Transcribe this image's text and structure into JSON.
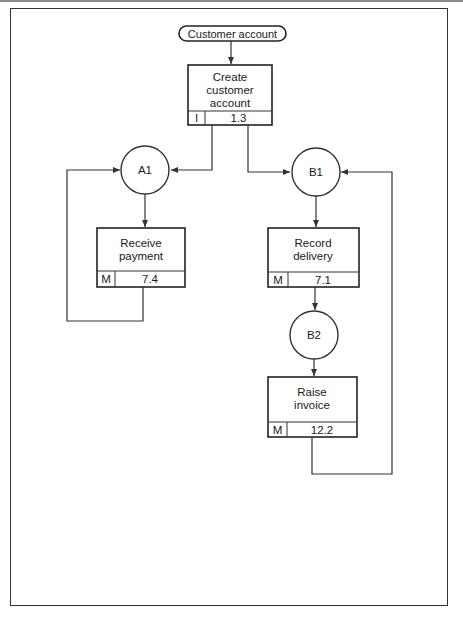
{
  "diagram": {
    "start": {
      "label": "Customer account"
    },
    "processes": [
      {
        "id": "create",
        "lines": [
          "Create",
          "customer",
          "account"
        ],
        "type": "I",
        "number": "1.3"
      },
      {
        "id": "receive",
        "lines": [
          "Receive",
          "payment"
        ],
        "type": "M",
        "number": "7.4"
      },
      {
        "id": "record",
        "lines": [
          "Record",
          "delivery"
        ],
        "type": "M",
        "number": "7.1"
      },
      {
        "id": "raise",
        "lines": [
          "Raise",
          "invoice"
        ],
        "type": "M",
        "number": "12.2"
      }
    ],
    "states": [
      {
        "id": "A1",
        "label": "A1"
      },
      {
        "id": "B1",
        "label": "B1"
      },
      {
        "id": "B2",
        "label": "B2"
      }
    ],
    "colors": {
      "line": "#333333",
      "background": "#ffffff",
      "text": "#1a1a1a"
    }
  }
}
